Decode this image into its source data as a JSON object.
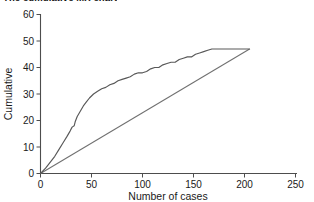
{
  "chart_data": {
    "type": "line",
    "title": "The cumulative MX chart",
    "xlabel": "Number of cases",
    "ylabel": "Cumulative",
    "xlim": [
      0,
      250
    ],
    "ylim": [
      0,
      60
    ],
    "xticks": [
      "0",
      "50",
      "100",
      "150",
      "200",
      "250"
    ],
    "yticks": [
      "0",
      "10",
      "20",
      "30",
      "40",
      "50",
      "60"
    ],
    "grid": false,
    "legend": "none",
    "series": [
      {
        "name": "cumulative-curve",
        "color": "#585858",
        "points": [
          [
            0,
            0
          ],
          [
            5,
            2
          ],
          [
            10,
            4.5
          ],
          [
            14,
            6.5
          ],
          [
            18,
            9
          ],
          [
            22,
            11.5
          ],
          [
            26,
            14
          ],
          [
            29,
            16
          ],
          [
            31,
            17.5
          ],
          [
            33,
            18
          ],
          [
            34,
            19.5
          ],
          [
            36,
            21.5
          ],
          [
            39,
            23.5
          ],
          [
            42,
            25.5
          ],
          [
            45,
            27
          ],
          [
            48,
            28.5
          ],
          [
            52,
            30
          ],
          [
            56,
            31
          ],
          [
            60,
            32
          ],
          [
            64,
            32.5
          ],
          [
            68,
            33.5
          ],
          [
            72,
            34
          ],
          [
            76,
            35
          ],
          [
            80,
            35.5
          ],
          [
            84,
            36
          ],
          [
            88,
            36.5
          ],
          [
            92,
            37.5
          ],
          [
            96,
            38
          ],
          [
            100,
            38
          ],
          [
            104,
            38.5
          ],
          [
            108,
            39.5
          ],
          [
            112,
            40
          ],
          [
            116,
            40
          ],
          [
            120,
            41
          ],
          [
            124,
            41.5
          ],
          [
            128,
            42
          ],
          [
            132,
            42
          ],
          [
            136,
            43
          ],
          [
            140,
            43.5
          ],
          [
            144,
            44
          ],
          [
            148,
            44
          ],
          [
            152,
            45
          ],
          [
            156,
            45.5
          ],
          [
            160,
            46
          ],
          [
            164,
            46.5
          ],
          [
            168,
            47
          ],
          [
            175,
            47
          ],
          [
            185,
            47
          ],
          [
            195,
            47
          ],
          [
            205,
            47
          ]
        ]
      },
      {
        "name": "reference-diagonal",
        "color": "#707070",
        "points": [
          [
            0,
            0
          ],
          [
            205,
            47
          ]
        ]
      }
    ]
  }
}
